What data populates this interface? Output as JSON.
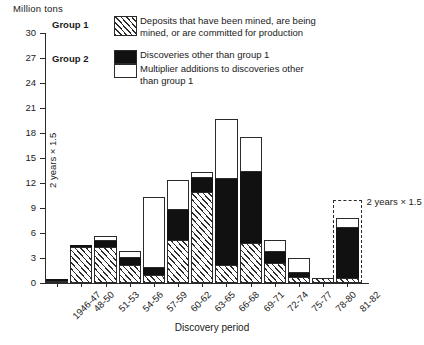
{
  "axis_label_top": "Million tons",
  "xaxis_title": "Discovery period",
  "inner_note": "2 years × 1.5",
  "projection_note": "2 years × 1.5",
  "legend": {
    "group1_label": "Group 1",
    "group2_label": "Group 2",
    "entries": [
      {
        "swatch": "hatch",
        "text": "Deposits that have been mined, are being\nmined, or are committed for production"
      },
      {
        "swatch": "black",
        "text": "Discoveries other than group 1"
      },
      {
        "swatch": "white",
        "text": "Multiplier additions to discoveries other\nthan group 1"
      }
    ]
  },
  "colors": {
    "ink": "#2b2b2b",
    "black_fill": "#111111",
    "white_fill": "#ffffff"
  },
  "chart_data": {
    "type": "bar",
    "subtype": "stacked",
    "title": "",
    "xlabel": "Discovery period",
    "ylabel": "Million tons",
    "ylim": [
      0,
      30
    ],
    "yticks": [
      0,
      3,
      6,
      9,
      12,
      15,
      18,
      21,
      24,
      27,
      30
    ],
    "grid": false,
    "legend_position": "top-center",
    "categories": [
      "1946-47",
      "48-50",
      "51-53",
      "54-56",
      "57-59",
      "60-62",
      "63-65",
      "66-68",
      "69-71",
      "72-74",
      "75-77",
      "78-80",
      "81-82"
    ],
    "series": [
      {
        "name": "Deposits that have been mined, are being mined, or are committed for production",
        "group": "Group 1",
        "fill": "hatch",
        "values": [
          0.2,
          4.3,
          4.3,
          2.2,
          1.0,
          5.2,
          10.9,
          2.2,
          4.8,
          2.4,
          0.7,
          0.6,
          0.6
        ]
      },
      {
        "name": "Discoveries other than group 1",
        "group": "Group 2",
        "fill": "black",
        "values": [
          0.3,
          0.3,
          0.7,
          0.8,
          0.8,
          3.6,
          1.7,
          10.3,
          8.5,
          1.3,
          0.5,
          0.0,
          6.0
        ]
      },
      {
        "name": "Multiplier additions to discoveries other than group 1",
        "group": "Group 2",
        "fill": "white",
        "values": [
          0.0,
          0.0,
          0.6,
          0.9,
          8.5,
          3.6,
          0.7,
          7.2,
          4.2,
          1.5,
          1.8,
          0.0,
          1.2
        ]
      }
    ],
    "totals": [
      0.5,
      4.6,
      5.6,
      3.9,
      10.3,
      12.4,
      13.3,
      19.7,
      17.5,
      5.2,
      3.0,
      0.6,
      7.8
    ],
    "annotations": [
      {
        "text": "2 years × 1.5",
        "category": "81-82",
        "kind": "dashed-projection-box",
        "projected_total": 10.0
      },
      {
        "text": "2 years × 1.5",
        "category": "1946-47",
        "kind": "rotated-inner-note"
      }
    ]
  }
}
